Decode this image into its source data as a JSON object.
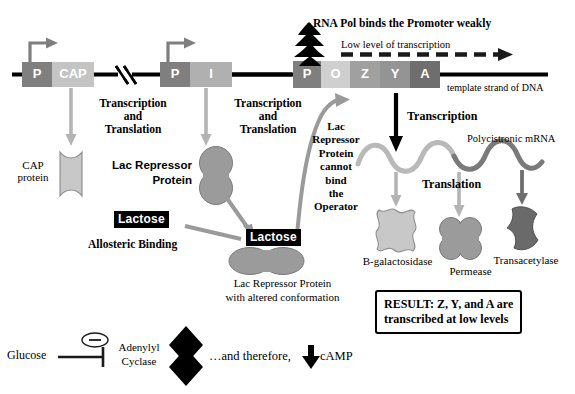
{
  "diagram": {
    "colors": {
      "promoter_gray": "#7f7f7f",
      "cap_gray": "#c4c4c4",
      "i_gray": "#b0b0b0",
      "operator_gray": "#cfcfcf",
      "z_gray": "#a0a0a0",
      "y_gray": "#949494",
      "a_gray": "#6e6e6e",
      "protein_light": "#c8c8c8",
      "protein_mid": "#9b9b9b",
      "protein_dark": "#6a6a6a",
      "arrow_gray": "#b4b4b4",
      "arrow_mid": "#9a9a9a",
      "black": "#000000",
      "dna_line": "#000000",
      "mrna_light": "#b9b9b9",
      "mrna_dark": "#7a7a7a"
    }
  },
  "dna": {
    "template_label": "template strand of DNA",
    "cap_region": {
      "promoter_letter": "P",
      "gene_letter": "CAP"
    },
    "i_region": {
      "promoter_letter": "P",
      "gene_letter": "I"
    },
    "operon": {
      "letters": [
        "P",
        "O",
        "Z",
        "Y",
        "A"
      ]
    }
  },
  "rna_pol": {
    "label": "RNA Pol binds the Promoter weakly",
    "transcription_level_label": "Low level of transcription"
  },
  "left_branch": {
    "process_line1": "Transcription",
    "process_line2": "and",
    "process_line3": "Translation",
    "product_line1": "CAP",
    "product_line2": "protein"
  },
  "middle_branch": {
    "process_line1": "Transcription",
    "process_line2": "and",
    "process_line3": "Translation",
    "product_line1": "Lac Repressor",
    "product_line2": "Protein",
    "lactose_label": "Lactose",
    "allosteric_label": "Allosteric Binding",
    "bound_lactose_label": "Lactose",
    "altered_line1": "Lac Repressor Protein",
    "altered_line2": "with altered conformation"
  },
  "repressor_note": {
    "lines": [
      "Lac",
      "Repressor",
      "Protein",
      "cannot",
      "bind",
      "the",
      "Operator"
    ]
  },
  "right_branch": {
    "transcription_label": "Transcription",
    "mrna_label": "Polycistronic mRNA",
    "translation_label": "Translation",
    "products": [
      {
        "name": "B-galactosidase"
      },
      {
        "name": "Permease"
      },
      {
        "name": "Transacetylase"
      }
    ],
    "result_line1": "RESULT: Z, Y, and A are",
    "result_line2": "transcribed at low levels"
  },
  "bottom": {
    "glucose_label": "Glucose",
    "inhibition_symbol": "−",
    "adenylyl_line1": "Adenylyl",
    "adenylyl_line2": "Cyclase",
    "therefore_text": "…and therefore,",
    "camp_label": "cAMP"
  }
}
